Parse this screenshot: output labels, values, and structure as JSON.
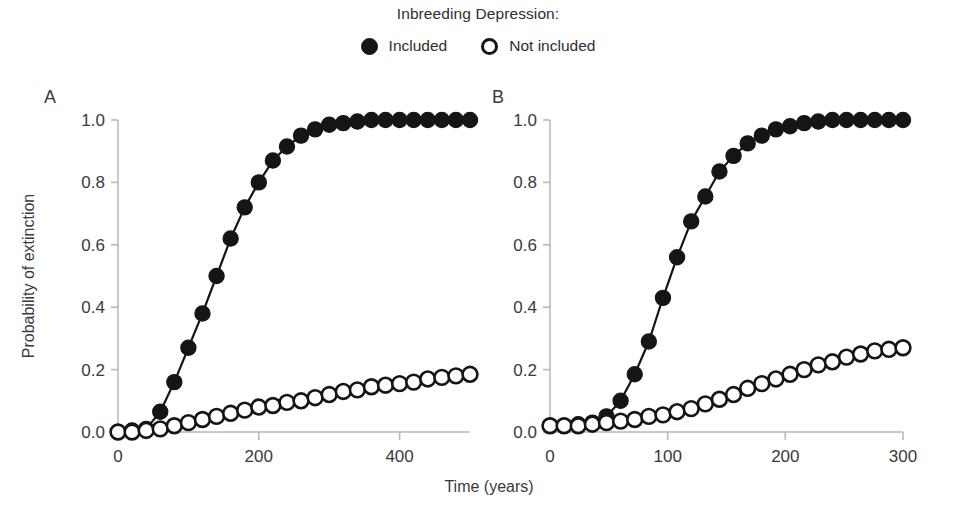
{
  "figure": {
    "legend_title": "Inbreeding Depression:",
    "axis_x_title": "Time (years)",
    "axis_y_title": "Probability of extinction",
    "series_colors": {
      "filled": "#151515",
      "open_fill": "#ffffff",
      "open_stroke": "#151515",
      "axis": "#b9b9b9"
    },
    "legend_entries": [
      {
        "marker": "filled-circle-icon",
        "label": "Included"
      },
      {
        "marker": "open-circle-icon",
        "label": "Not included"
      }
    ]
  },
  "chart_data": [
    {
      "type": "line",
      "panel": "A",
      "title": "",
      "xlabel": "Time (years)",
      "ylabel": "Probability of extinction",
      "xlim": [
        0,
        500
      ],
      "ylim": [
        0.0,
        1.0
      ],
      "xticks": [
        0,
        200,
        400
      ],
      "xtick_labels": [
        "0",
        "200",
        "400"
      ],
      "yticks": [
        0.0,
        0.2,
        0.4,
        0.6,
        0.8,
        1.0
      ],
      "ytick_labels": [
        "0.0",
        "0.2",
        "0.4",
        "0.6",
        "0.8",
        "1.0"
      ],
      "grid": false,
      "legend_position": "top-center",
      "series": [
        {
          "name": "Included",
          "marker": "filled-circle",
          "x": [
            0,
            20,
            40,
            60,
            80,
            100,
            120,
            140,
            160,
            180,
            200,
            220,
            240,
            260,
            280,
            300,
            320,
            340,
            360,
            380,
            400,
            420,
            440,
            460,
            480,
            500
          ],
          "values": [
            0.0,
            0.005,
            0.01,
            0.065,
            0.16,
            0.27,
            0.38,
            0.5,
            0.62,
            0.72,
            0.8,
            0.87,
            0.915,
            0.95,
            0.97,
            0.985,
            0.99,
            0.995,
            1.0,
            1.0,
            1.0,
            1.0,
            1.0,
            1.0,
            1.0,
            1.0
          ]
        },
        {
          "name": "Not included",
          "marker": "open-circle",
          "x": [
            0,
            20,
            40,
            60,
            80,
            100,
            120,
            140,
            160,
            180,
            200,
            220,
            240,
            260,
            280,
            300,
            320,
            340,
            360,
            380,
            400,
            420,
            440,
            460,
            480,
            500
          ],
          "values": [
            0.0,
            0.0,
            0.005,
            0.01,
            0.02,
            0.03,
            0.04,
            0.05,
            0.06,
            0.07,
            0.08,
            0.085,
            0.095,
            0.1,
            0.11,
            0.12,
            0.13,
            0.135,
            0.145,
            0.15,
            0.155,
            0.16,
            0.17,
            0.175,
            0.18,
            0.185
          ]
        }
      ]
    },
    {
      "type": "line",
      "panel": "B",
      "title": "",
      "xlabel": "Time (years)",
      "ylabel": "",
      "xlim": [
        0,
        300
      ],
      "ylim": [
        0.0,
        1.0
      ],
      "xticks": [
        0,
        100,
        200,
        300
      ],
      "xtick_labels": [
        "0",
        "100",
        "200",
        "300"
      ],
      "yticks": [
        0.0,
        0.2,
        0.4,
        0.6,
        0.8,
        1.0
      ],
      "ytick_labels": [
        "0.0",
        "0.2",
        "0.4",
        "0.6",
        "0.8",
        "1.0"
      ],
      "grid": false,
      "legend_position": "top-center",
      "series": [
        {
          "name": "Included",
          "marker": "filled-circle",
          "x": [
            0,
            12,
            24,
            36,
            48,
            60,
            72,
            84,
            96,
            108,
            120,
            132,
            144,
            156,
            168,
            180,
            192,
            204,
            216,
            228,
            240,
            252,
            264,
            276,
            288,
            300
          ],
          "values": [
            0.02,
            0.02,
            0.025,
            0.03,
            0.05,
            0.1,
            0.185,
            0.29,
            0.43,
            0.56,
            0.675,
            0.755,
            0.835,
            0.885,
            0.925,
            0.95,
            0.97,
            0.98,
            0.99,
            0.995,
            1.0,
            1.0,
            1.0,
            1.0,
            1.0,
            1.0
          ]
        },
        {
          "name": "Not included",
          "marker": "open-circle",
          "x": [
            0,
            12,
            24,
            36,
            48,
            60,
            72,
            84,
            96,
            108,
            120,
            132,
            144,
            156,
            168,
            180,
            192,
            204,
            216,
            228,
            240,
            252,
            264,
            276,
            288,
            300
          ],
          "values": [
            0.02,
            0.02,
            0.02,
            0.025,
            0.03,
            0.035,
            0.04,
            0.05,
            0.055,
            0.065,
            0.075,
            0.09,
            0.105,
            0.12,
            0.14,
            0.155,
            0.17,
            0.185,
            0.2,
            0.215,
            0.225,
            0.24,
            0.25,
            0.26,
            0.265,
            0.27
          ]
        }
      ]
    }
  ],
  "panels": [
    {
      "letter": "A"
    },
    {
      "letter": "B"
    }
  ]
}
